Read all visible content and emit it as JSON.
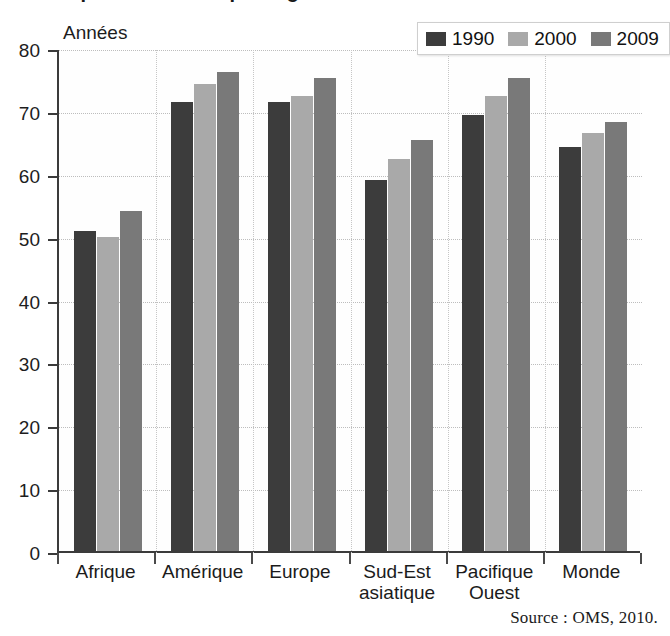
{
  "figure": {
    "title_fragment": "L'espérance de vie par région",
    "y_axis_title": "Années",
    "source_note": "Source : OMS, 2010."
  },
  "legend": {
    "position": "top-right",
    "items": [
      {
        "label": "1990",
        "color": "#3c3c3c",
        "swatch_name": "legend-swatch-1990"
      },
      {
        "label": "2000",
        "color": "#a9a9a9",
        "swatch_name": "legend-swatch-2000"
      },
      {
        "label": "2009",
        "color": "#797979",
        "swatch_name": "legend-swatch-2009"
      }
    ]
  },
  "axes": {
    "y_ticks": [
      "80",
      "70",
      "60",
      "50",
      "40",
      "30",
      "20",
      "10",
      "0"
    ],
    "x_labels": [
      {
        "line1": "Afrique",
        "line2": ""
      },
      {
        "line1": "Amérique",
        "line2": ""
      },
      {
        "line1": "Europe",
        "line2": ""
      },
      {
        "line1": "Sud-Est",
        "line2": "asiatique"
      },
      {
        "line1": "Pacifique",
        "line2": "Ouest"
      },
      {
        "line1": "Monde",
        "line2": ""
      }
    ]
  },
  "chart_data": {
    "type": "bar",
    "title": "L'espérance de vie par région",
    "xlabel": "",
    "ylabel": "Années",
    "ylim": [
      0,
      80
    ],
    "ytick_step": 10,
    "grid": true,
    "legend_position": "top-right",
    "categories": [
      "Afrique",
      "Amérique",
      "Europe",
      "Sud-Est asiatique",
      "Pacifique Ouest",
      "Monde"
    ],
    "series": [
      {
        "name": "1990",
        "color": "#3c3c3c",
        "values": [
          50.9,
          71.4,
          71.4,
          59.0,
          69.3,
          64.3
        ]
      },
      {
        "name": "2000",
        "color": "#a9a9a9",
        "values": [
          50.0,
          74.3,
          72.3,
          62.3,
          72.3,
          66.5
        ]
      },
      {
        "name": "2009",
        "color": "#797979",
        "values": [
          54.0,
          76.2,
          75.3,
          65.3,
          75.3,
          68.3
        ]
      }
    ],
    "annotations": [
      "Source : OMS, 2010."
    ]
  },
  "colors": {
    "axis": "#3b3b3b",
    "grid": "#bdbdbd",
    "background": "#ffffff",
    "text": "#1b1b1b"
  }
}
